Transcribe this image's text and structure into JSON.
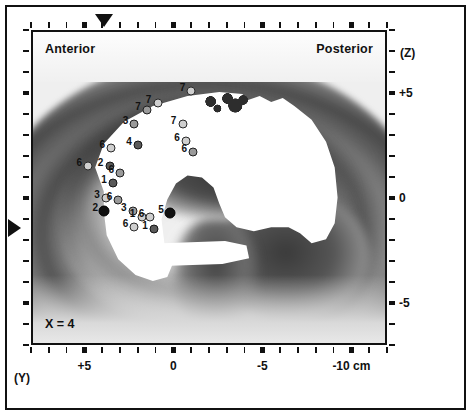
{
  "figure": {
    "orientation": {
      "anterior": "Anterior",
      "posterior": "Posterior"
    },
    "slice_label": "X = 4"
  },
  "axes": {
    "x_axis_name": "(Y)",
    "y_axis_name": "(Z)",
    "x_ticklabels": [
      "+5",
      "0",
      "-5",
      "-10 cm"
    ],
    "y_ticklabels": [
      "+5",
      "0",
      "-5"
    ]
  },
  "chart_data": {
    "type": "scatter",
    "title": "",
    "subtitle": "",
    "xlabel": "(Y)",
    "ylabel": "(Z)",
    "units": "cm",
    "slice": "X = 4",
    "xlim": [
      8,
      -12
    ],
    "ylim": [
      -7,
      8
    ],
    "x_ticks": [
      5,
      0,
      -5,
      -10
    ],
    "y_ticks": [
      5,
      0,
      -5
    ],
    "x_ticklabels": [
      "+5",
      "0",
      "-5",
      "-10 cm"
    ],
    "y_ticklabels": [
      "+5",
      "0",
      "-5"
    ],
    "grid": false,
    "legend": null,
    "background": "sagittal brain slice, grayscale, with white suprathreshold activation overlay",
    "annotations": [
      {
        "text": "Anterior",
        "position": "top-left"
      },
      {
        "text": "Posterior",
        "position": "top-right"
      },
      {
        "text": "X = 4",
        "position": "bottom-left"
      }
    ],
    "crosshair": {
      "x_pointer": 5.0,
      "z_pointer": 0.0
    },
    "points": [
      {
        "label": "7",
        "x": -0.9,
        "y": 5.2,
        "shade": "light"
      },
      {
        "label": "7",
        "x": 1.0,
        "y": 4.6,
        "shade": "light"
      },
      {
        "label": "7",
        "x": 1.6,
        "y": 4.3,
        "shade": "mid"
      },
      {
        "label": "7",
        "x": -0.4,
        "y": 3.6,
        "shade": "light"
      },
      {
        "label": "3",
        "x": 2.3,
        "y": 3.6,
        "shade": "mid"
      },
      {
        "label": "6",
        "x": -0.6,
        "y": 2.8,
        "shade": "light"
      },
      {
        "label": "6",
        "x": -1.0,
        "y": 2.3,
        "shade": "mid"
      },
      {
        "label": "4",
        "x": 2.1,
        "y": 2.6,
        "shade": "dark"
      },
      {
        "label": "6",
        "x": 3.6,
        "y": 2.5,
        "shade": "light"
      },
      {
        "label": "6",
        "x": 4.9,
        "y": 1.6,
        "shade": "light"
      },
      {
        "label": "2",
        "x": 3.7,
        "y": 1.6,
        "shade": "dark"
      },
      {
        "label": "6",
        "x": 3.1,
        "y": 1.3,
        "shade": "mid"
      },
      {
        "label": "1",
        "x": 3.5,
        "y": 0.8,
        "shade": "dark"
      },
      {
        "label": "3",
        "x": 3.9,
        "y": 0.1,
        "shade": "light"
      },
      {
        "label": "6",
        "x": 3.2,
        "y": 0.0,
        "shade": "mid"
      },
      {
        "label": "2",
        "x": 4.0,
        "y": -0.5,
        "shade": "black"
      },
      {
        "label": "3",
        "x": 2.4,
        "y": -0.5,
        "shade": "mid"
      },
      {
        "label": "1",
        "x": 1.9,
        "y": -0.8,
        "shade": "light"
      },
      {
        "label": "6",
        "x": 1.4,
        "y": -0.8,
        "shade": "light"
      },
      {
        "label": "5",
        "x": 0.3,
        "y": -0.6,
        "shade": "black"
      },
      {
        "label": "6",
        "x": 2.3,
        "y": -1.3,
        "shade": "light"
      },
      {
        "label": "1",
        "x": 1.2,
        "y": -1.4,
        "shade": "dark"
      }
    ]
  }
}
